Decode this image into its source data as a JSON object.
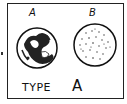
{
  "card": {
    "wells": [
      {
        "label": "A",
        "state": "clumped",
        "description": "agglutinated"
      },
      {
        "label": "B",
        "state": "speckled",
        "description": "not agglutinated"
      }
    ],
    "result_label": "TYPE",
    "result_value": "A"
  },
  "colors": {
    "ink": "#111111",
    "background": "#ffffff"
  }
}
